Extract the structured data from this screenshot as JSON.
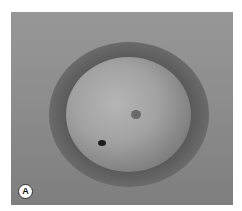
{
  "figure": {
    "panel_label": "A"
  }
}
